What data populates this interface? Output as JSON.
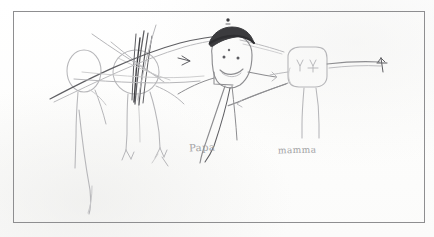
{
  "artwork": {
    "medium": "pencil on paper",
    "title": "children's family drawing",
    "paper_color": "#fefefe",
    "frame_color": "#8e8e90",
    "graphite_color": "#8d8d90",
    "graphite_dark_color": "#4a4a4d",
    "graphite_light_color": "#b9b9bb"
  },
  "labels": [
    {
      "name": "papa-label",
      "text": "Papa",
      "x": 189,
      "y": 142
    },
    {
      "name": "mamma-label",
      "text": "mamma",
      "x": 278,
      "y": 145
    }
  ],
  "figures": [
    {
      "name": "figure-left-outer",
      "description": "faint oval-headed figure, far left, long leg trailing to bottom",
      "head_shape": "oval",
      "shade": "light"
    },
    {
      "name": "figure-left-inner",
      "description": "oval-headed figure scribbled over with dark vertical strokes",
      "head_shape": "oval",
      "shade": "light",
      "scribbled_out": "true"
    },
    {
      "name": "figure-papa",
      "description": "central figure with dark hair, two eyes, nose dot and smiling mouth",
      "head_shape": "round",
      "shade": "dark",
      "label": "Papa"
    },
    {
      "name": "figure-mamma",
      "description": "right figure with rounded-square head and long arm reaching to the right edge",
      "head_shape": "rounded-square",
      "shade": "light",
      "label": "mamma"
    }
  ],
  "marks": [
    {
      "name": "dot-above-head",
      "description": "small dark dot above papa's hair"
    },
    {
      "name": "long-sweeping-line",
      "description": "long arcing line crossing the whole drawing from left edge to papa's head"
    },
    {
      "name": "cross-hatch-scribble",
      "description": "heavy crossing strokes over the second figure"
    }
  ]
}
